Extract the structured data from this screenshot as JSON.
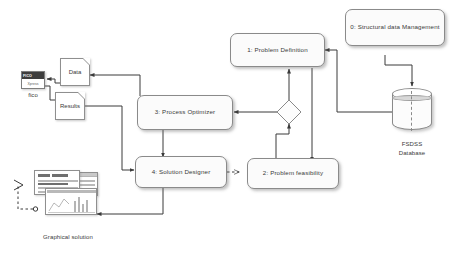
{
  "diagram": {
    "background": "#ffffff",
    "line_color": "#3a3a3a",
    "node_fill": "#fbfbfb",
    "node_border": "#8a8a8a"
  },
  "nodes": {
    "structural_data_management": {
      "id": "0",
      "label": "0: Structural data Management",
      "line1": "0: Structural data",
      "line2": "Management"
    },
    "problem_definition": {
      "id": "1",
      "label": "1: Problem Definition"
    },
    "process_optimizer": {
      "id": "3",
      "label": "3: Process Optimizer"
    },
    "solution_designer": {
      "id": "4",
      "label": "4: Solution Designer"
    },
    "problem_feasibility": {
      "id": "2",
      "label": "2: Problem feasibility"
    },
    "decision": {
      "label": ""
    }
  },
  "artifacts": {
    "data_doc": {
      "label": "Data"
    },
    "results_doc": {
      "label": "Results"
    },
    "fico": {
      "caption": "fico",
      "logo_top": "FICO",
      "logo_bottom": "Xpress"
    },
    "database": {
      "caption_line1": "FSDSS",
      "caption_line2": "Database"
    },
    "graphical_solution": {
      "caption": "Graphical solution"
    }
  },
  "edges": [
    {
      "from": "structural_data_management",
      "to": "database",
      "style": "solid",
      "arrow": "filled"
    },
    {
      "from": "database",
      "to": "problem_definition",
      "style": "solid",
      "arrow": "filled"
    },
    {
      "from": "problem_definition",
      "to": "problem_feasibility",
      "style": "solid",
      "arrow": "filled"
    },
    {
      "from": "problem_feasibility",
      "to": "decision",
      "style": "solid",
      "arrow": "filled"
    },
    {
      "from": "decision",
      "to": "problem_definition",
      "style": "solid",
      "arrow": "filled"
    },
    {
      "from": "decision",
      "to": "process_optimizer",
      "style": "solid",
      "arrow": "filled"
    },
    {
      "from": "process_optimizer",
      "to": "data_doc",
      "style": "solid",
      "arrow": "filled"
    },
    {
      "from": "process_optimizer",
      "to": "solution_designer",
      "style": "solid",
      "arrow": "filled"
    },
    {
      "from": "results_doc",
      "to": "solution_designer",
      "style": "solid",
      "arrow": "filled"
    },
    {
      "from": "data_doc",
      "to": "fico",
      "style": "solid",
      "arrow": "filled"
    },
    {
      "from": "fico",
      "to": "results_doc",
      "style": "solid",
      "arrow": "filled"
    },
    {
      "from": "solution_designer",
      "to": "problem_feasibility",
      "style": "dashed",
      "arrow": "open"
    },
    {
      "from": "solution_designer",
      "to": "graphical_solution",
      "style": "solid",
      "arrow": "filled"
    },
    {
      "from": "graphical_solution",
      "to": "uml-actor",
      "style": "dashed",
      "arrow": "open"
    }
  ]
}
